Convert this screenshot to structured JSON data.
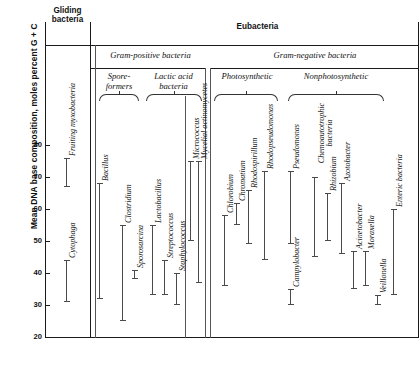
{
  "chart_data": {
    "type": "bar",
    "orientation": "vertical-range",
    "title": "",
    "xlabel": "",
    "ylabel": "Mean DNA base composition, moles percent G + C",
    "ylim": [
      20,
      86
    ],
    "yticks": [
      20,
      30,
      40,
      50,
      60,
      70,
      80
    ],
    "grid": false,
    "legend": false,
    "value_unit": "moles percent G + C",
    "note": "Each vertical bar spans the observed minimum-to-maximum mean DNA base composition (mol% G+C) for that taxon.",
    "groups": [
      {
        "name": "Gliding bacteria",
        "style": "bold",
        "level": 1,
        "subgroups": [],
        "taxa": [
          {
            "label": "Fruiting myxobacteria",
            "min": 67,
            "max": 76
          },
          {
            "label": "Cytophaga",
            "min": 31,
            "max": 44
          }
        ]
      },
      {
        "name": "Eubacteria",
        "style": "bold",
        "level": 1,
        "subgroups": [
          {
            "name": "Gram-positive bacteria",
            "style": "italic",
            "level": 2,
            "subgroups": [
              {
                "name": "Spore-formers",
                "style": "italic",
                "level": 3,
                "taxa": [
                  {
                    "label": "Bacillus",
                    "min": 32,
                    "max": 68
                  },
                  {
                    "label": "Clostridium",
                    "min": 25,
                    "max": 55
                  },
                  {
                    "label": "Sporosarcina",
                    "min": 38,
                    "max": 41
                  }
                ]
              },
              {
                "name": "Lactic acid bacteria",
                "style": "italic",
                "level": 3,
                "taxa": [
                  {
                    "label": "Lactobacillus",
                    "min": 33,
                    "max": 55
                  },
                  {
                    "label": "Streptococcus",
                    "min": 33,
                    "max": 44
                  },
                  {
                    "label": "Staphylococcus",
                    "min": 30,
                    "max": 40
                  },
                  {
                    "label": "Micrococcus",
                    "min": 50,
                    "max": 75
                  }
                ]
              }
            ],
            "taxa": []
          },
          {
            "name": "Mycelial actinomycetes",
            "style": "standalone",
            "level": 3,
            "taxa": [
              {
                "label": "Mycelial actinomycetes",
                "min": 37,
                "max": 75
              }
            ]
          },
          {
            "name": "Gram-negative bacteria",
            "style": "italic",
            "level": 2,
            "subgroups": [
              {
                "name": "Photosynthetic",
                "style": "italic",
                "level": 3,
                "taxa": [
                  {
                    "label": "Chlorobium",
                    "min": 36,
                    "max": 58
                  },
                  {
                    "label": "Chromatium",
                    "min": 55,
                    "max": 62
                  },
                  {
                    "label": "Rhodospirillum",
                    "min": 49,
                    "max": 66
                  },
                  {
                    "label": "Rhodopseudomonas",
                    "min": 44,
                    "max": 72
                  }
                ]
              },
              {
                "name": "Nonphotosynthetic",
                "style": "italic",
                "level": 3,
                "taxa": [
                  {
                    "label": "Pseudomonas",
                    "min": 49,
                    "max": 72
                  },
                  {
                    "label": "Campylobacter",
                    "min": 30,
                    "max": 35
                  },
                  {
                    "label": "Chemoautotrophic bacteria",
                    "min": 45,
                    "max": 70
                  },
                  {
                    "label": "Rhizobium",
                    "min": 50,
                    "max": 65
                  },
                  {
                    "label": "Azotobacter",
                    "min": 46,
                    "max": 68
                  },
                  {
                    "label": "Acinetobacter",
                    "min": 35,
                    "max": 47
                  },
                  {
                    "label": "Moraxella",
                    "min": 36,
                    "max": 47
                  },
                  {
                    "label": "Veillonella",
                    "min": 30,
                    "max": 33
                  },
                  {
                    "label": "Enteric bacteria",
                    "min": 33,
                    "max": 60
                  }
                ]
              }
            ],
            "taxa": []
          }
        ],
        "taxa": []
      }
    ]
  },
  "axis": {
    "title": "Mean DNA base composition, moles percent G + C",
    "tick_labels": [
      "80",
      "70",
      "60",
      "50",
      "40",
      "30",
      "20"
    ]
  },
  "headers": {
    "gliding": "Gliding\nbacteria",
    "gliding_line1": "Gliding",
    "gliding_line2": "bacteria",
    "eubacteria": "Eubacteria",
    "gram_positive": "Gram-positive bacteria",
    "gram_negative": "Gram-negative bacteria",
    "spore_line1": "Spore-",
    "spore_line2": "formers",
    "lactic_line1": "Lactic acid",
    "lactic_line2": "bacteria",
    "photosynthetic": "Photosynthetic",
    "nonphotosynthetic": "Nonphotosynthetic"
  },
  "bars": {
    "fruiting_myxobacteria": "Fruiting myxobacteria",
    "cytophaga": "Cytophaga",
    "bacillus": "Bacillus",
    "clostridium": "Clostridium",
    "sporosarcina": "Sporosarcina",
    "lactobacillus": "Lactobacillus",
    "streptococcus": "Streptococcus",
    "staphylococcus": "Staphylococcus",
    "micrococcus": "Micrococcus",
    "mycelial_actinomycetes": "Mycelial actinomycetes",
    "chlorobium": "Chlorobium",
    "chromatium": "Chromatium",
    "rhodospirillum": "Rhodospirillum",
    "rhodopseudomonas": "Rhodopseudomonas",
    "pseudomonas": "Pseudomonas",
    "campylobacter": "Campylobacter",
    "chemo_line1": "Chemoautotrophic",
    "chemo_line2": "bacteria",
    "rhizobium": "Rhizobium",
    "azotobacter": "Azotobacter",
    "acinetobacter": "Acinetobacter",
    "moraxella": "Moraxella",
    "veillonella": "Veillonella",
    "enteric_bacteria": "Enteric bacteria"
  },
  "colors": {
    "background": "#ffffff",
    "axis": "#1a1a1a",
    "bar": "#4a4a4a",
    "text": "#111111"
  }
}
